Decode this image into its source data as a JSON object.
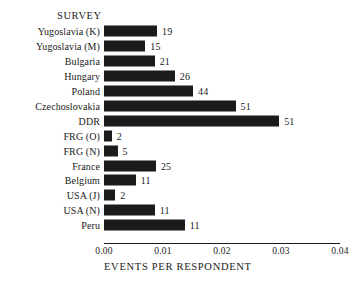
{
  "chart_data": {
    "type": "bar",
    "orientation": "horizontal",
    "title": "",
    "series_title": "SURVEY",
    "xlabel": "EVENTS PER RESPONDENT",
    "ylabel": "",
    "xlim": [
      0.0,
      0.04
    ],
    "xticks": [
      "0.00",
      "0.01",
      "0.02",
      "0.03",
      "0.04"
    ],
    "xtick_values": [
      0.0,
      0.01,
      0.02,
      0.03,
      0.04
    ],
    "grid": false,
    "legend": "none",
    "bar_color": "#1b1b1b",
    "categories": [
      "Yugoslavia (K)",
      "Yugoslavia (M)",
      "Bulgaria",
      "Hungary",
      "Poland",
      "Czechoslovakia",
      "DDR",
      "FRG (O)",
      "FRG (N)",
      "France",
      "Belgium",
      "USA (J)",
      "USA (N)",
      "Peru"
    ],
    "values": [
      0.009,
      0.007,
      0.0086,
      0.012,
      0.0151,
      0.0223,
      0.0297,
      0.0013,
      0.0023,
      0.0088,
      0.0054,
      0.0019,
      0.0086,
      0.0137
    ],
    "point_labels": [
      "19",
      "15",
      "21",
      "26",
      "44",
      "51",
      "51",
      "2",
      "5",
      "25",
      "11",
      "2",
      "11",
      "11"
    ]
  }
}
